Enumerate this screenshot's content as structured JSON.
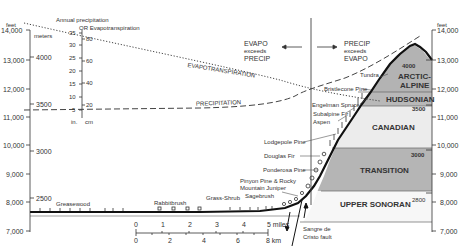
{
  "left_feet_axis": {
    "unit": "feet",
    "ticks": [
      "14,000",
      "13,000",
      "12,000",
      "11,000",
      "10,000",
      "9,000",
      "8,000",
      "7,000"
    ]
  },
  "left_meters_axis": {
    "unit": "meters",
    "ticks": [
      "4000",
      "3500",
      "3000",
      "2500"
    ]
  },
  "precip_axis": {
    "title_line1": "Annual precipitation",
    "title_line2": "OR Evapotranspiration",
    "in_ticks": [
      "35",
      "30",
      "25",
      "20",
      "15",
      "10",
      "5"
    ],
    "cm_ticks": [
      "80",
      "60",
      "40",
      "20"
    ],
    "in_label": "in.",
    "cm_label": "cm"
  },
  "right_feet_axis": {
    "unit": "feet",
    "ticks": [
      "14,000",
      "13,000",
      "12,000",
      "11,000",
      "10,000",
      "9,000",
      "8,000",
      "7,000"
    ]
  },
  "curves": {
    "evapotranspiration": "EVAPOTRANSPIRATION",
    "precipitation": "PRECIPITATION"
  },
  "regions": {
    "left": {
      "line1": "EVAPO",
      "line2": "exceeds",
      "line3": "PRECIP"
    },
    "right": {
      "line1": "PRECIP",
      "line2": "exceeds",
      "line3": "EVAPO"
    }
  },
  "zones": [
    {
      "name": "ARCTIC-",
      "name2": "ALPINE",
      "top_m": "4000",
      "fill": "#b3b3b3"
    },
    {
      "name": "HUDSONIAN",
      "top_m": "",
      "fill": "#b8b8b8"
    },
    {
      "name": "CANADIAN",
      "top_m": "3500",
      "fill": "#ececec"
    },
    {
      "name": "TRANSITION",
      "top_m": "3000",
      "fill": "#b5b5b5"
    },
    {
      "name": "UPPER SONORAN",
      "top_m": "2800",
      "fill": "#f7f7f7"
    }
  ],
  "vegetation_labels": [
    "Tundra",
    "Bristlecone Pine",
    "Engelman Spruce",
    "Subalpine Fir",
    "Aspen",
    "Lodgepole Pine",
    "Douglas Fir",
    "Ponderosa Pine",
    "Pinyon Pine & Rocky",
    "Mountain Juniper",
    "Sagebrush",
    "Grass-Shrub",
    "Rabbitbrush",
    "Greasewood"
  ],
  "scale_bar": {
    "miles_ticks": [
      "0",
      "1",
      "2",
      "3",
      "4",
      "5 miles"
    ],
    "km_ticks": [
      "0",
      "2",
      "4",
      "6",
      "8 km"
    ]
  },
  "fault_label_line1": "Sangre de",
  "fault_label_line2": "Cristo fault"
}
